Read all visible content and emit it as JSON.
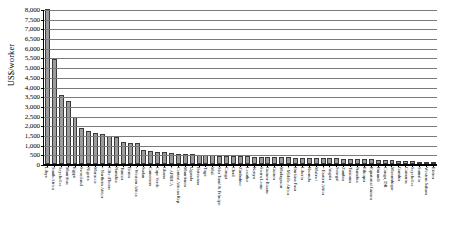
{
  "chart_data": {
    "type": "bar",
    "title": "",
    "xlabel": "",
    "ylabel": "US$/worker",
    "ylim": [
      0,
      8000
    ],
    "ytick_step": 500,
    "grid": true,
    "legend": "none",
    "note": "First bar (Libya) is clipped at the top of the axis. Entries prefixed with a bullet are regional aggregates.",
    "yticks": [
      "8,000",
      "7,500",
      "7,000",
      "6,500",
      "6,000",
      "5,500",
      "5,000",
      "4,500",
      "4,000",
      "3,500",
      "3,000",
      "2,500",
      "2,000",
      "1,500",
      "1,000",
      "500",
      "0"
    ],
    "categories": [
      "Libya",
      "South Africa",
      "Seychelles",
      "Mauritius",
      "Egypt",
      "Swaziland",
      "Nigeria",
      "Morocco",
      "Northern Africa",
      "Côte d'Ivoire",
      "Namibia",
      "Tunisia",
      "Benin",
      "Western Africa",
      "Sudan",
      "Cameroon",
      "Cape Verde",
      "Ghana",
      "AFRICA",
      "Central African Rep.",
      "Mauritania",
      "Uganda",
      "Botswana",
      "Togo",
      "Mali",
      "São Tomé & Príncipe",
      "Congo",
      "Chad",
      "Zimbabwe",
      "Lesotho",
      "Kenya",
      "Sierra Leone",
      "Guinea-Bissau",
      "Guinea",
      "Madagascar",
      "Middle Africa",
      "Burkina Faso",
      "Liberia",
      "Rwanda",
      "Malawi",
      "Eastern Africa",
      "Angola",
      "Senegal",
      "Zambia",
      "Tanzania",
      "Namibia",
      "Ethiopia",
      "Equatorial Guinea",
      "Burundi",
      "Congo, DR",
      "Mozambique",
      "Gambia",
      "Comoros",
      "Seychelles",
      "Somalia",
      "Western Sahara",
      "Eritrea"
    ],
    "values": [
      8000,
      5400,
      3550,
      3250,
      2450,
      1850,
      1700,
      1620,
      1560,
      1450,
      1420,
      1150,
      1100,
      1080,
      700,
      650,
      620,
      600,
      560,
      540,
      520,
      500,
      480,
      460,
      440,
      430,
      420,
      410,
      400,
      390,
      380,
      370,
      360,
      350,
      345,
      340,
      330,
      320,
      315,
      310,
      300,
      290,
      285,
      275,
      265,
      255,
      245,
      235,
      225,
      210,
      195,
      180,
      160,
      140,
      120,
      95,
      70
    ],
    "bar_color": "#9d9d9d",
    "bar_border_color": "#3a3a3a",
    "gridline_color": "#7a7a7a",
    "axis_color": "#000000"
  }
}
